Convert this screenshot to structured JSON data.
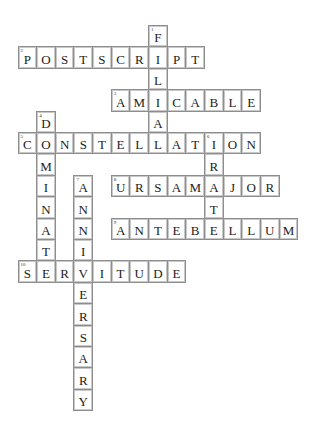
{
  "puzzle": {
    "type": "crossword",
    "entries": [
      {
        "number": "1",
        "direction": "down",
        "answer": "FILIAL",
        "row": 0,
        "col": 7
      },
      {
        "number": "2",
        "direction": "across",
        "answer": "POSTSCRIPT",
        "row": 1,
        "col": 0
      },
      {
        "number": "3",
        "direction": "across",
        "answer": "AMICABLE",
        "row": 3,
        "col": 5
      },
      {
        "number": "4",
        "direction": "down",
        "answer": "DOMINATE",
        "row": 4,
        "col": 1
      },
      {
        "number": "5",
        "direction": "across",
        "answer": "CONSTELLATION",
        "row": 5,
        "col": 0
      },
      {
        "number": "6",
        "direction": "down",
        "answer": "IRATE",
        "row": 5,
        "col": 10
      },
      {
        "number": "7",
        "direction": "down",
        "answer": "ANNIVERSARY",
        "row": 7,
        "col": 3
      },
      {
        "number": "8",
        "direction": "across",
        "answer": "URSAMAJOR",
        "row": 7,
        "col": 5
      },
      {
        "number": "9",
        "direction": "across",
        "answer": "ANTEBELLUM",
        "row": 9,
        "col": 5
      },
      {
        "number": "10",
        "direction": "across",
        "answer": "SERVITUDE",
        "row": 11,
        "col": 0
      }
    ]
  }
}
